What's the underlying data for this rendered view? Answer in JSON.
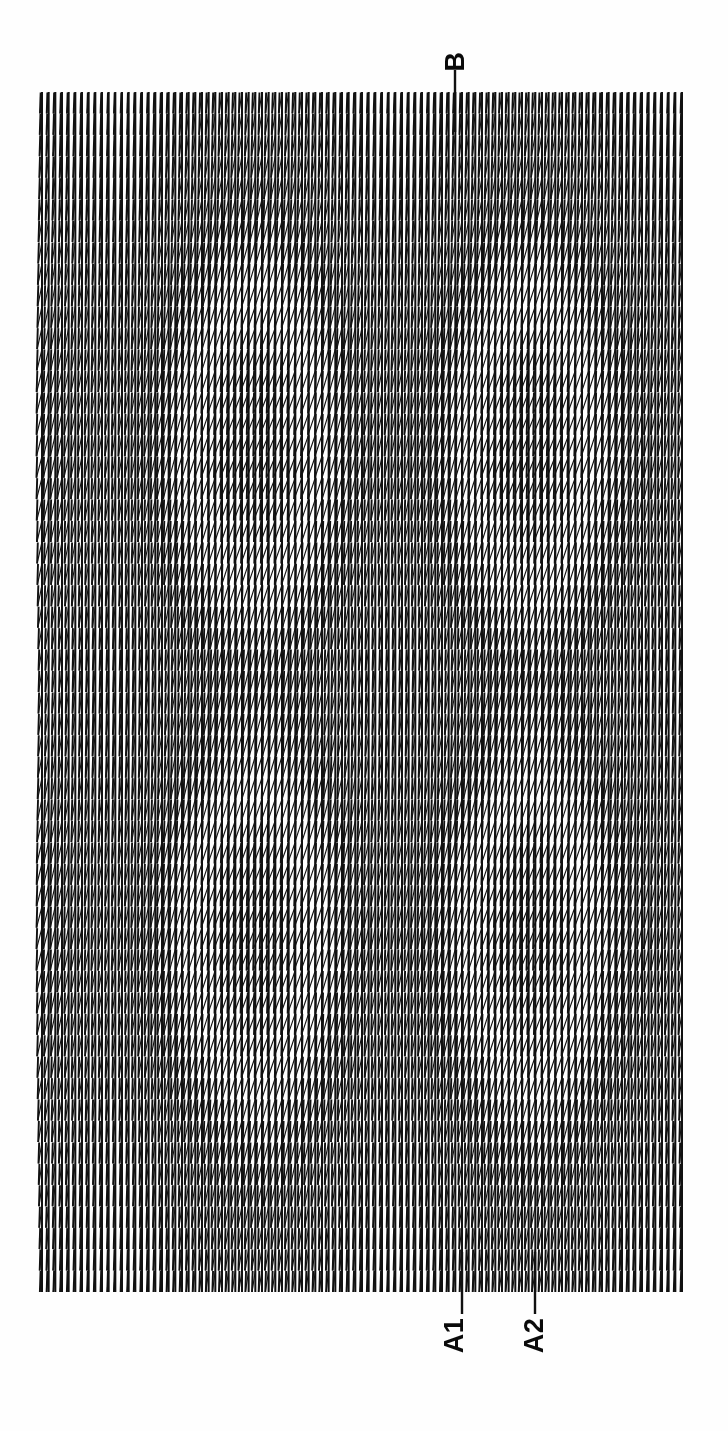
{
  "figure": {
    "kind": "strip-chart-recorder-trace",
    "orientation": "rotated-90-ccw",
    "background_color": "#fefefe",
    "ink_color": "#111111"
  },
  "markers": [
    {
      "id": "B",
      "label": "B",
      "position": "top",
      "x_px": 455,
      "note": "extended stroke above the comb"
    },
    {
      "id": "A1",
      "label": "A1",
      "position": "bottom",
      "x_px": 462,
      "note": "extended stroke below the comb"
    },
    {
      "id": "A2",
      "label": "A2",
      "position": "bottom",
      "x_px": 535,
      "note": "extended stroke below the comb"
    }
  ],
  "chart_data": {
    "type": "line",
    "title": "",
    "subtitle": "",
    "xlabel": "",
    "ylabel": "",
    "grid": false,
    "legend": null,
    "annotations": [
      {
        "text": "B",
        "x": 455,
        "y": 72,
        "rotation": -90
      },
      {
        "text": "A1",
        "x": 455,
        "y": 1345,
        "rotation": -90
      },
      {
        "text": "A2",
        "x": 535,
        "y": 1345,
        "rotation": -90
      }
    ],
    "plot_area": {
      "x0": 42,
      "x1": 682,
      "y0": 92,
      "y1": 1292
    },
    "sweep": {
      "description": "Continuous sawtooth pen sweep: fast near-vertical rise, slow slanted return, drawn repeatedly across the chart width.",
      "n_sweeps": 96,
      "sweep_pitch_px": 6.68,
      "rise_is_vertical": true,
      "return_slant_px_per_row": -0.55
    },
    "envelope": {
      "description": "Return-stroke length (trace amplitude) varies slowly across the chart, producing wide dark bands and narrow light bands.",
      "x": [
        0,
        0.06,
        0.12,
        0.18,
        0.24,
        0.3,
        0.36,
        0.42,
        0.48,
        0.54,
        0.6,
        0.66,
        0.72,
        0.78,
        0.84,
        0.9,
        0.96,
        1.0
      ],
      "values": [
        0.62,
        0.48,
        0.4,
        0.55,
        0.78,
        0.95,
        1.0,
        0.86,
        0.62,
        0.46,
        0.52,
        0.72,
        0.92,
        1.0,
        0.88,
        0.66,
        0.5,
        0.44
      ]
    },
    "vertical_envelope": {
      "description": "Down-page modulation of the zigzag amplitude — tight near top and bottom edges, broad through the middle thirds.",
      "y": [
        0.0,
        0.08,
        0.16,
        0.24,
        0.32,
        0.4,
        0.48,
        0.56,
        0.64,
        0.72,
        0.8,
        0.88,
        0.96,
        1.0
      ],
      "values": [
        0.34,
        0.52,
        0.76,
        0.96,
        1.0,
        0.84,
        0.6,
        0.72,
        0.95,
        1.0,
        0.86,
        0.64,
        0.44,
        0.36
      ]
    }
  }
}
